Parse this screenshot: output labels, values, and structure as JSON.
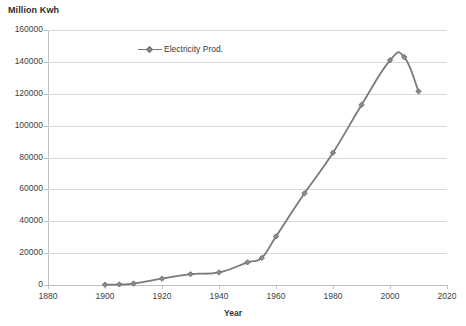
{
  "chart_data": {
    "type": "line",
    "title": "",
    "ylabel": "Million Kwh",
    "xlabel": "Year",
    "xlim": [
      1880,
      2020
    ],
    "ylim": [
      0,
      160000
    ],
    "xticks": [
      1880,
      1900,
      1920,
      1940,
      1960,
      1980,
      2000,
      2020
    ],
    "yticks": [
      0,
      20000,
      40000,
      60000,
      80000,
      100000,
      120000,
      140000,
      160000
    ],
    "grid": true,
    "legend_position": "inside-top-left",
    "series": [
      {
        "name": "Electricity Prod.",
        "color": "#7a7a7a",
        "marker": "diamond",
        "x": [
          1900,
          1905,
          1910,
          1920,
          1930,
          1940,
          1950,
          1955,
          1960,
          1970,
          1980,
          1990,
          2000,
          2005,
          2010
        ],
        "values": [
          200,
          400,
          900,
          4000,
          6800,
          7900,
          14200,
          17000,
          30500,
          57500,
          83000,
          113000,
          141000,
          143000,
          121500
        ]
      }
    ]
  },
  "axes": {
    "y_title": "Million Kwh",
    "x_title": "Year",
    "y_tick_labels": [
      "160000",
      "140000",
      "120000",
      "100000",
      "80000",
      "60000",
      "40000",
      "20000",
      "0"
    ],
    "x_tick_labels": [
      "1880",
      "1900",
      "1920",
      "1940",
      "1960",
      "1980",
      "2000",
      "2020"
    ]
  },
  "legend": {
    "entries": [
      {
        "label": "Electricity Prod."
      }
    ]
  },
  "colors": {
    "series": "#7a7a7a",
    "marker_fill": "#8a8a8a",
    "marker_stroke": "#6e6e6e",
    "grid": "#d9d9d9",
    "axis": "#bfbfbf",
    "text": "#404040",
    "background": "#ffffff"
  }
}
